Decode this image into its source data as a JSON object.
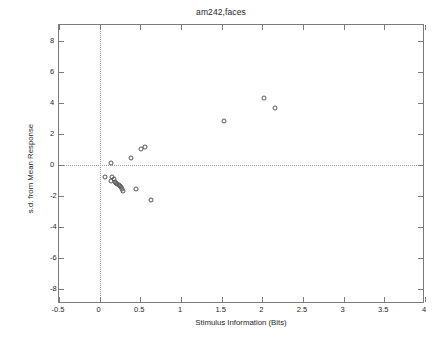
{
  "chart_data": {
    "type": "scatter",
    "title": "am242,faces",
    "xlabel": "Stimulus Information (Bits)",
    "ylabel": "s.d. from Mean Response",
    "xlim": [
      -0.5,
      4
    ],
    "ylim": [
      -9,
      9
    ],
    "xticks": [
      -0.5,
      0,
      0.5,
      1,
      1.5,
      2,
      2.5,
      3,
      3.5,
      4
    ],
    "xticklabels": [
      "-0.5",
      "0",
      "0.5",
      "1",
      "1.5",
      "2",
      "2.5",
      "3",
      "3.5",
      "4"
    ],
    "yticks": [
      8,
      6,
      4,
      2,
      0,
      -2,
      -4,
      -6,
      -8
    ],
    "yticklabels": [
      "8",
      "6",
      "4",
      "2",
      "0",
      "-2",
      "-4",
      "-6",
      "-8"
    ],
    "grid": false,
    "legend": null,
    "marker": "open-circle",
    "marker_color": "#555555",
    "reference_lines": [
      {
        "axis": "x",
        "value": 0,
        "style": "dotted"
      },
      {
        "axis": "y",
        "value": 0,
        "style": "dotted"
      }
    ],
    "points": [
      {
        "x": 0.135,
        "y": 0.1
      },
      {
        "x": 0.065,
        "y": -0.78
      },
      {
        "x": 0.155,
        "y": -0.8
      },
      {
        "x": 0.175,
        "y": -0.92
      },
      {
        "x": 0.145,
        "y": -1.05
      },
      {
        "x": 0.19,
        "y": -1.12
      },
      {
        "x": 0.205,
        "y": -1.18
      },
      {
        "x": 0.215,
        "y": -1.28
      },
      {
        "x": 0.235,
        "y": -1.33
      },
      {
        "x": 0.25,
        "y": -1.4
      },
      {
        "x": 0.265,
        "y": -1.45
      },
      {
        "x": 0.275,
        "y": -1.55
      },
      {
        "x": 0.285,
        "y": -1.7
      },
      {
        "x": 0.385,
        "y": 0.45
      },
      {
        "x": 0.51,
        "y": 1.02
      },
      {
        "x": 0.56,
        "y": 1.12
      },
      {
        "x": 0.45,
        "y": -1.58
      },
      {
        "x": 0.635,
        "y": -2.28
      },
      {
        "x": 1.525,
        "y": 2.82
      },
      {
        "x": 2.02,
        "y": 4.28
      },
      {
        "x": 2.155,
        "y": 3.65
      }
    ]
  }
}
